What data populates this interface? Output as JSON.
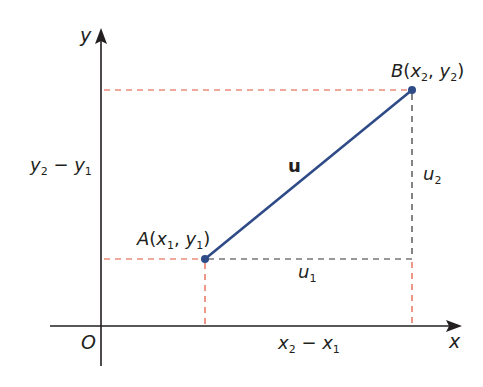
{
  "diagram": {
    "type": "vector-components",
    "axes": {
      "x_label": "x",
      "y_label": "y",
      "origin_label": "O"
    },
    "points": {
      "A": {
        "name": "A",
        "coord1": "x",
        "sub1": "1",
        "coord2": "y",
        "sub2": "1"
      },
      "B": {
        "name": "B",
        "coord1": "x",
        "sub1": "2",
        "coord2": "y",
        "sub2": "2"
      }
    },
    "vector_label": "u",
    "components": {
      "u1": {
        "base": "u",
        "sub": "1"
      },
      "u2": {
        "base": "u",
        "sub": "2"
      }
    },
    "differences": {
      "dx": {
        "a": "x",
        "a_sub": "2",
        "op": " − ",
        "b": "x",
        "b_sub": "1"
      },
      "dy": {
        "a": "y",
        "a_sub": "2",
        "op": " − ",
        "b": "y",
        "b_sub": "1"
      }
    },
    "colors": {
      "axis": "#231f20",
      "vector": "#2e4a87",
      "point": "#2e4a87",
      "projection_dash": "#e0523a",
      "component_dash": "#333333"
    }
  }
}
